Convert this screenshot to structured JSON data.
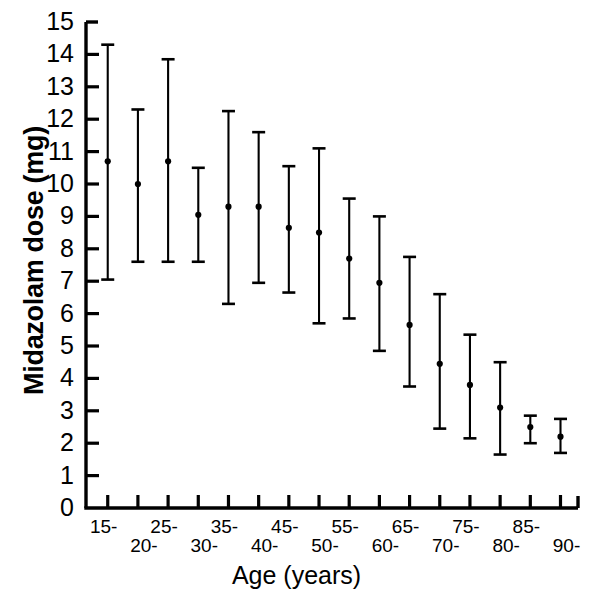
{
  "chart_data": {
    "type": "scatter",
    "title": "",
    "xlabel": "Age (years)",
    "ylabel": "Midazolam dose (mg)",
    "ylim": [
      0,
      15
    ],
    "yticks": [
      0,
      1,
      2,
      3,
      4,
      5,
      6,
      7,
      8,
      9,
      10,
      11,
      12,
      13,
      14,
      15
    ],
    "ytick_labels": [
      "0",
      "1",
      "2",
      "3",
      "4",
      "5",
      "6",
      "7",
      "8",
      "9",
      "10",
      "11",
      "12",
      "13",
      "14",
      "15"
    ],
    "grid": false,
    "legend": null,
    "error_bar_style": "mean with upper and lower capped whiskers",
    "categories": [
      "15-",
      "20-",
      "25-",
      "30-",
      "35-",
      "40-",
      "45-",
      "50-",
      "55-",
      "60-",
      "65-",
      "70-",
      "75-",
      "80-",
      "85-",
      "90-"
    ],
    "xtick_labels": [
      "15-",
      "20-",
      "25-",
      "30-",
      "35-",
      "40-",
      "45-",
      "50-",
      "55-",
      "60-",
      "65-",
      "70-",
      "75-",
      "80-",
      "85-",
      "90-"
    ],
    "series": [
      {
        "name": "Midazolam dose",
        "values": [
          10.7,
          10.0,
          10.7,
          9.05,
          9.3,
          9.3,
          8.65,
          8.5,
          7.7,
          6.95,
          5.65,
          4.45,
          3.8,
          3.1,
          2.5,
          2.2
        ],
        "upper": [
          14.3,
          12.3,
          13.85,
          10.5,
          12.25,
          11.6,
          10.55,
          11.1,
          9.55,
          9.0,
          7.75,
          6.6,
          5.35,
          4.5,
          2.85,
          2.75
        ],
        "lower": [
          7.05,
          7.6,
          7.6,
          7.6,
          6.3,
          6.95,
          6.65,
          5.7,
          5.85,
          4.85,
          3.75,
          2.45,
          2.15,
          1.65,
          2.0,
          1.7
        ]
      }
    ]
  },
  "axes": {
    "y_axis_name": "Midazolam dose (mg)",
    "x_axis_name": "Age (years)"
  },
  "style": {
    "ink": "#000000",
    "background": "#ffffff"
  }
}
